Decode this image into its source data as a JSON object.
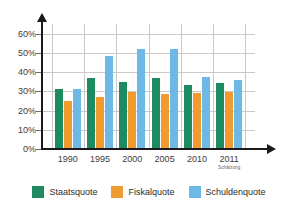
{
  "chart_data": {
    "type": "bar",
    "title": "",
    "xlabel": "",
    "ylabel": "",
    "categories": [
      "1990",
      "1995",
      "2000",
      "2005",
      "2010",
      "2011"
    ],
    "category_notes": [
      "",
      "",
      "",
      "",
      "",
      "Schätzung"
    ],
    "series": [
      {
        "name": "Staatsquote",
        "color": "#1d8a60",
        "values": [
          31.0,
          37.0,
          34.8,
          37.0,
          33.5,
          34.2
        ]
      },
      {
        "name": "Fiskalquote",
        "color": "#ef9b2f",
        "values": [
          25.0,
          27.0,
          29.8,
          28.8,
          29.0,
          29.8
        ]
      },
      {
        "name": "Schuldenquote",
        "color": "#6cb9e8",
        "values": [
          31.2,
          48.2,
          52.0,
          52.0,
          37.5,
          36.0
        ]
      }
    ],
    "ylim": [
      0,
      65
    ],
    "yticks": [
      0,
      10,
      20,
      30,
      40,
      50,
      60
    ],
    "ytick_labels": [
      "0%",
      "10%",
      "20%",
      "30%",
      "40%",
      "50%",
      "60%"
    ],
    "grid": true,
    "grid_vertical": true,
    "legend_position": "bottom"
  },
  "legend": {
    "items": [
      {
        "label": "Staatsquote"
      },
      {
        "label": "Fiskalquote"
      },
      {
        "label": "Schuldenquote"
      }
    ]
  }
}
